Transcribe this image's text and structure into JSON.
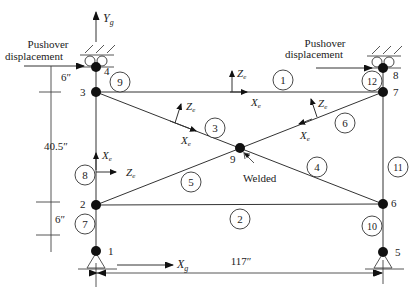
{
  "diagram": {
    "type": "structural-frame",
    "colors": {
      "line": "#333333",
      "node": "#111111",
      "background": "#ffffff"
    },
    "global_axes": {
      "y_label": "Y",
      "y_sub": "g",
      "x_label": "X",
      "x_sub": "g"
    },
    "element_axes": {
      "x_label": "X",
      "z_label": "Z",
      "sub": "e"
    },
    "pushover_left": {
      "line1": "Pushover",
      "line2": "displacement"
    },
    "pushover_right": {
      "line1": "Pushover",
      "line2": "displacement"
    },
    "dimensions": {
      "top_offset": "6″",
      "height": "40.5″",
      "bottom_offset": "6″",
      "width": "117″"
    },
    "welded_label": "Welded",
    "nodes": [
      {
        "id": "1",
        "label": "1"
      },
      {
        "id": "2",
        "label": "2"
      },
      {
        "id": "3",
        "label": "3"
      },
      {
        "id": "4",
        "label": "4"
      },
      {
        "id": "5",
        "label": "5"
      },
      {
        "id": "6",
        "label": "6"
      },
      {
        "id": "7",
        "label": "7"
      },
      {
        "id": "8",
        "label": "8"
      },
      {
        "id": "9",
        "label": "9"
      }
    ],
    "elements": [
      {
        "id": "1",
        "label": "1"
      },
      {
        "id": "2",
        "label": "2"
      },
      {
        "id": "3",
        "label": "3"
      },
      {
        "id": "4",
        "label": "4"
      },
      {
        "id": "5",
        "label": "5"
      },
      {
        "id": "6",
        "label": "6"
      },
      {
        "id": "7",
        "label": "7"
      },
      {
        "id": "8",
        "label": "8"
      },
      {
        "id": "9",
        "label": "9"
      },
      {
        "id": "10",
        "label": "10"
      },
      {
        "id": "11",
        "label": "11"
      },
      {
        "id": "12",
        "label": "12"
      }
    ]
  }
}
